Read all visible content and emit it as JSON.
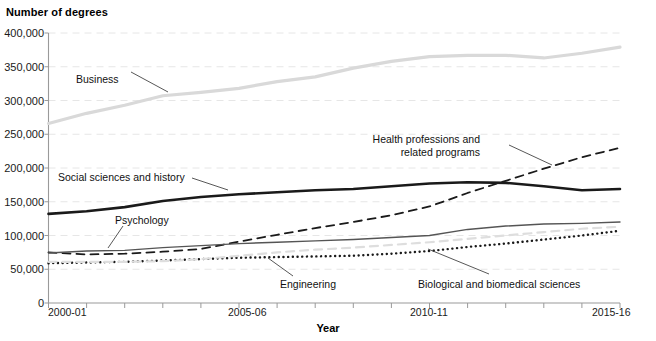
{
  "chart_data": {
    "type": "line",
    "title": "",
    "ylabel": "Number of degrees",
    "xlabel": "Year",
    "ylim": [
      0,
      400000
    ],
    "grid": true,
    "legend_position": "inline-annotations",
    "categories": [
      "2000-01",
      "2001-02",
      "2002-03",
      "2003-04",
      "2004-05",
      "2005-06",
      "2006-07",
      "2007-08",
      "2008-09",
      "2009-10",
      "2010-11",
      "2011-12",
      "2012-13",
      "2013-14",
      "2014-15",
      "2015-16"
    ],
    "y_ticks": [
      "0",
      "50,000",
      "100,000",
      "150,000",
      "200,000",
      "250,000",
      "300,000",
      "350,000",
      "400,000"
    ],
    "y_tick_values": [
      0,
      50000,
      100000,
      150000,
      200000,
      250000,
      300000,
      350000,
      400000
    ],
    "x_tick_labels_shown": [
      "2000-01",
      "2005-06",
      "2010-11",
      "2015-16"
    ],
    "series": [
      {
        "name": "Business",
        "style": "solid",
        "color": "#d9d9d9",
        "width": 3.2,
        "values": [
          266000,
          281000,
          293000,
          307000,
          312000,
          318000,
          328000,
          335000,
          348000,
          358000,
          365000,
          367000,
          367000,
          363000,
          370000,
          379000
        ]
      },
      {
        "name": "Social sciences and history",
        "style": "solid",
        "color": "#1a1a1a",
        "width": 2.6,
        "values": [
          132000,
          136000,
          142000,
          151000,
          157000,
          161000,
          164000,
          167000,
          169000,
          173000,
          177000,
          179000,
          178000,
          173000,
          167000,
          169000
        ]
      },
      {
        "name": "Health professions and related programs",
        "style": "dashed",
        "color": "#1a1a1a",
        "width": 1.8,
        "values": [
          75000,
          72000,
          73000,
          76000,
          80000,
          91000,
          101000,
          111000,
          120000,
          130000,
          143000,
          163000,
          181000,
          199000,
          216000,
          230000
        ]
      },
      {
        "name": "Psychology",
        "style": "solid",
        "color": "#555555",
        "width": 1.4,
        "values": [
          74000,
          77000,
          78000,
          82000,
          85000,
          88000,
          90000,
          92000,
          94000,
          97000,
          100000,
          109000,
          114000,
          117000,
          118000,
          120000
        ]
      },
      {
        "name": "Engineering",
        "style": "dotted",
        "color": "#1a1a1a",
        "width": 2.4,
        "values": [
          59000,
          60000,
          61000,
          63000,
          65000,
          67000,
          68000,
          69000,
          70000,
          73000,
          77000,
          83000,
          88000,
          94000,
          100000,
          107000
        ]
      },
      {
        "name": "Biological and biomedical sciences",
        "style": "dashed",
        "color": "#dedede",
        "width": 2.2,
        "values": [
          61000,
          61000,
          61000,
          62000,
          65000,
          70000,
          75000,
          79000,
          82000,
          86000,
          90000,
          95000,
          100000,
          105000,
          110000,
          113000
        ]
      }
    ],
    "annotations": [
      {
        "text": "Business",
        "series": "Business"
      },
      {
        "text": "Social sciences and history",
        "series": "Social sciences and history"
      },
      {
        "text": "Health professions and\nrelated programs",
        "series": "Health professions and related programs"
      },
      {
        "text": "Psychology",
        "series": "Psychology"
      },
      {
        "text": "Engineering",
        "series": "Engineering"
      },
      {
        "text": "Biological and biomedical sciences",
        "series": "Biological and biomedical sciences"
      }
    ]
  },
  "labels": {
    "y_axis_title": "Number of degrees",
    "x_axis_title": "Year",
    "ann_business": "Business",
    "ann_social": "Social sciences and history",
    "ann_health_l1": "Health professions and",
    "ann_health_l2": "related programs",
    "ann_psychology": "Psychology",
    "ann_engineering": "Engineering",
    "ann_biological": "Biological and biomedical sciences"
  },
  "y_tick_labels": {
    "t0": "0",
    "t1": "50,000",
    "t2": "100,000",
    "t3": "150,000",
    "t4": "200,000",
    "t5": "250,000",
    "t6": "300,000",
    "t7": "350,000",
    "t8": "400,000"
  },
  "x_tick_labels": {
    "x0": "2000-01",
    "x1": "2005-06",
    "x2": "2010-11",
    "x3": "2015-16"
  }
}
